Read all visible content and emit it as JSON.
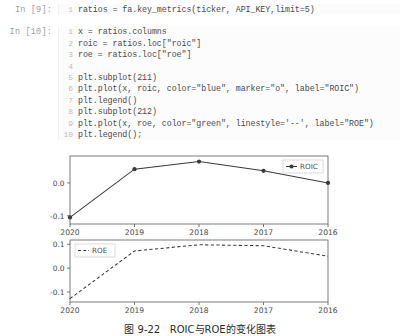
{
  "notebook": {
    "cells": [
      {
        "prompt": "In [9]:",
        "line_numbers": "1",
        "code": "ratios = fa.key_metrics(ticker, API_KEY,limit=5)"
      },
      {
        "prompt": "In [10]:",
        "line_numbers": " 1\n 2\n 3\n 4\n 5\n 6\n 7\n 8\n 9\n10",
        "code": "x = ratios.columns\nroic = ratios.loc[\"roic\"]\nroe = ratios.loc[\"roe\"]\n\nplt.subplot(211)\nplt.plot(x, roic, color=\"blue\", marker=\"o\", label=\"ROIC\")\nplt.legend()\nplt.subplot(212)\nplt.plot(x, roe, color=\"green\", linestyle='--', label=\"ROE\")\nplt.legend();"
      }
    ]
  },
  "caption": "图 9-22   ROIC与ROE的变化图表",
  "chart_data": [
    {
      "type": "line",
      "subplot": "211",
      "title": "",
      "xlabel": "",
      "ylabel": "",
      "categories": [
        "2020",
        "2019",
        "2018",
        "2017",
        "2016"
      ],
      "series": [
        {
          "name": "ROIC",
          "label": "ROIC",
          "color": "#3a3a3a",
          "marker": "o",
          "linestyle": "-",
          "values": [
            -0.105,
            0.042,
            0.065,
            0.037,
            0.0
          ]
        }
      ],
      "yticks": [
        0.0,
        -0.1
      ],
      "ytick_labels": [
        "0.0",
        "-0.1"
      ],
      "ylim": [
        -0.125,
        0.082
      ],
      "xtick_labels": [
        "2020",
        "2019",
        "2018",
        "2017",
        "2016"
      ],
      "grid": false,
      "legend_position": "upper right",
      "legend_label": "ROIC"
    },
    {
      "type": "line",
      "subplot": "212",
      "title": "",
      "xlabel": "",
      "ylabel": "",
      "categories": [
        "2020",
        "2019",
        "2018",
        "2017",
        "2016"
      ],
      "series": [
        {
          "name": "ROE",
          "label": "ROE",
          "color": "#3a3a3a",
          "marker": "",
          "linestyle": "--",
          "values": [
            -0.128,
            0.072,
            0.098,
            0.094,
            0.05
          ]
        }
      ],
      "yticks": [
        0.1,
        0.0,
        -0.1
      ],
      "ytick_labels": [
        "0.1",
        "0.0",
        "-0.1"
      ],
      "ylim": [
        -0.142,
        0.118
      ],
      "xtick_labels": [
        "2020",
        "2019",
        "2018",
        "2017",
        "2016"
      ],
      "grid": false,
      "legend_position": "upper left",
      "legend_label": "ROE"
    }
  ]
}
